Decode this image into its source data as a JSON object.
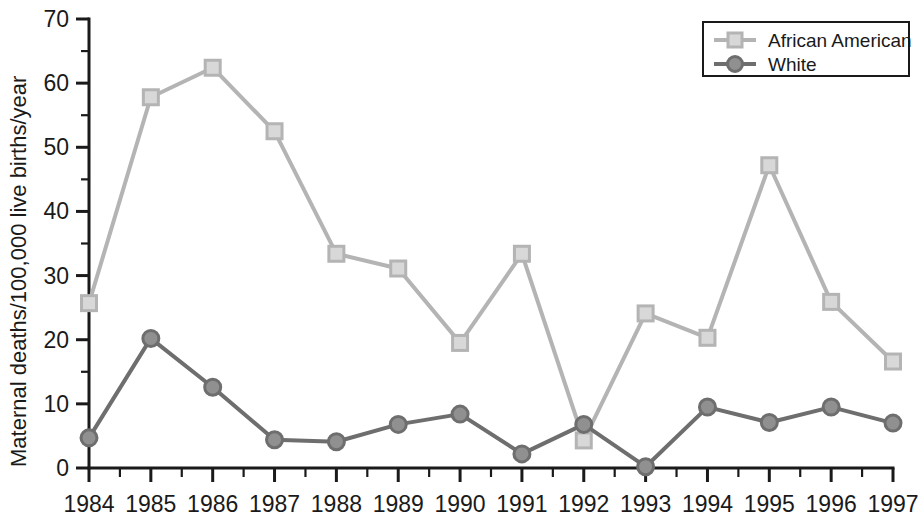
{
  "chart_data": {
    "type": "line",
    "title": "",
    "xlabel": "",
    "ylabel": "Maternal deaths/100,000 live births/year",
    "categories": [
      1984,
      1985,
      1986,
      1987,
      1988,
      1989,
      1990,
      1991,
      1992,
      1993,
      1994,
      1995,
      1996,
      1997
    ],
    "x_tick_labels": [
      "1984",
      "1985",
      "1986",
      "1987",
      "1988",
      "1989",
      "1990",
      "1991",
      "1992",
      "1993",
      "1994",
      "1995",
      "1996",
      "1997"
    ],
    "y_tick_labels": [
      "0",
      "10",
      "20",
      "30",
      "40",
      "50",
      "60",
      "70"
    ],
    "y_ticks": [
      0,
      10,
      20,
      30,
      40,
      50,
      60,
      70
    ],
    "ylim": [
      0,
      70
    ],
    "xlim": [
      1984,
      1997
    ],
    "y_minor_ticks": true,
    "x_minor_ticks": true,
    "grid": false,
    "legend_position": "top-right",
    "series": [
      {
        "name": "African American",
        "color": "#b4b4b4",
        "marker": "square",
        "marker_fill": "#d8d8d8",
        "values": [
          25.7,
          57.8,
          62.4,
          52.5,
          33.4,
          31.1,
          19.5,
          33.4,
          4.3,
          24.1,
          20.3,
          47.2,
          25.9,
          16.6
        ]
      },
      {
        "name": "White",
        "color": "#6e6e6e",
        "marker": "circle",
        "marker_fill": "#909090",
        "values": [
          4.7,
          20.2,
          12.6,
          4.4,
          4.1,
          6.8,
          8.4,
          2.2,
          6.8,
          0.2,
          9.5,
          7.1,
          9.5,
          7.0
        ]
      }
    ]
  },
  "legend": {
    "items": [
      {
        "label": "African American"
      },
      {
        "label": "White"
      }
    ]
  },
  "axis": {
    "y_title": "Maternal deaths/100,000 live births/year"
  }
}
